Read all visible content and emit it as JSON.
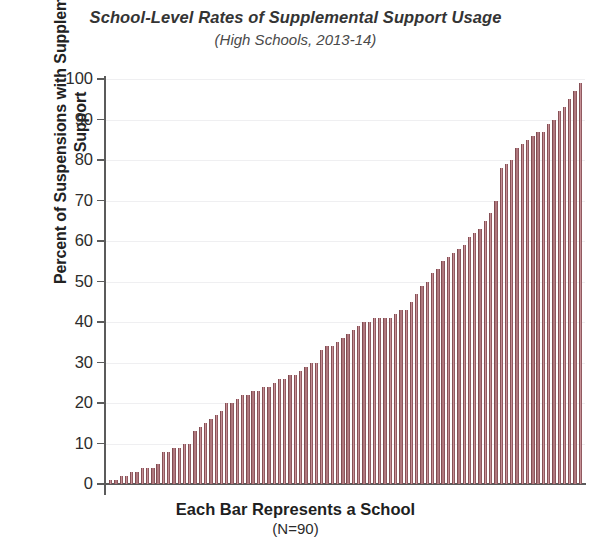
{
  "chart_data": {
    "type": "bar",
    "title": "School-Level Rates of Supplemental Support Usage",
    "subtitle": "(High Schools, 2013-14)",
    "xlabel": "Each Bar Represents a School",
    "xsublabel": "(N=90)",
    "ylabel": "Percent of Suspensions with Supplemental Support",
    "ylim": [
      0,
      100
    ],
    "yticks": [
      0,
      10,
      20,
      30,
      40,
      50,
      60,
      70,
      80,
      90,
      100
    ],
    "ytick_labels": [
      "0",
      "10",
      "20",
      "30",
      "40",
      "50",
      "60",
      "70",
      "80",
      "90",
      "100"
    ],
    "grid": true,
    "legend": "none",
    "n": 90,
    "bar_color": "#8f545a",
    "categories": [
      "1",
      "2",
      "3",
      "4",
      "5",
      "6",
      "7",
      "8",
      "9",
      "10",
      "11",
      "12",
      "13",
      "14",
      "15",
      "16",
      "17",
      "18",
      "19",
      "20",
      "21",
      "22",
      "23",
      "24",
      "25",
      "26",
      "27",
      "28",
      "29",
      "30",
      "31",
      "32",
      "33",
      "34",
      "35",
      "36",
      "37",
      "38",
      "39",
      "40",
      "41",
      "42",
      "43",
      "44",
      "45",
      "46",
      "47",
      "48",
      "49",
      "50",
      "51",
      "52",
      "53",
      "54",
      "55",
      "56",
      "57",
      "58",
      "59",
      "60",
      "61",
      "62",
      "63",
      "64",
      "65",
      "66",
      "67",
      "68",
      "69",
      "70",
      "71",
      "72",
      "73",
      "74",
      "75",
      "76",
      "77",
      "78",
      "79",
      "80",
      "81",
      "82",
      "83",
      "84",
      "85",
      "86",
      "87",
      "88",
      "89",
      "90"
    ],
    "values": [
      1,
      1,
      2,
      2,
      3,
      3,
      4,
      4,
      4,
      5,
      8,
      8,
      9,
      9,
      10,
      10,
      13,
      14,
      15,
      16,
      17,
      18,
      20,
      20,
      21,
      22,
      22,
      23,
      23,
      24,
      24,
      25,
      26,
      26,
      27,
      27,
      28,
      29,
      30,
      30,
      33,
      34,
      34,
      35,
      36,
      37,
      38,
      39,
      40,
      40,
      41,
      41,
      41,
      41,
      42,
      43,
      43,
      45,
      47,
      49,
      50,
      52,
      53,
      55,
      56,
      57,
      58,
      59,
      61,
      62,
      63,
      65,
      67,
      70,
      78,
      79,
      80,
      83,
      84,
      85,
      86,
      87,
      87,
      89,
      90,
      92,
      93,
      95,
      97,
      99
    ]
  }
}
